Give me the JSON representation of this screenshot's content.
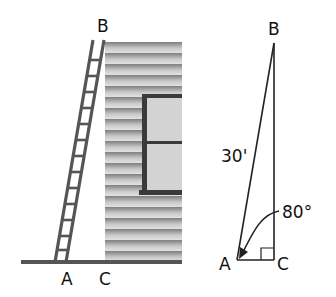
{
  "scene": {
    "labels": {
      "top": "B",
      "ladder_base": "A",
      "wall_base": "C"
    }
  },
  "triangle": {
    "labels": {
      "top": "B",
      "left": "A",
      "right": "C"
    },
    "hypotenuse_label": "30'",
    "angle_label": "80°"
  },
  "colors": {
    "ladder": "#555555",
    "wall_light": "#d6d6d6",
    "wall_dark": "#8a8a8a",
    "window_frame": "#3a3a3a",
    "window_glass": "#d3d3d3",
    "ground": "#555555",
    "line": "#222222"
  }
}
